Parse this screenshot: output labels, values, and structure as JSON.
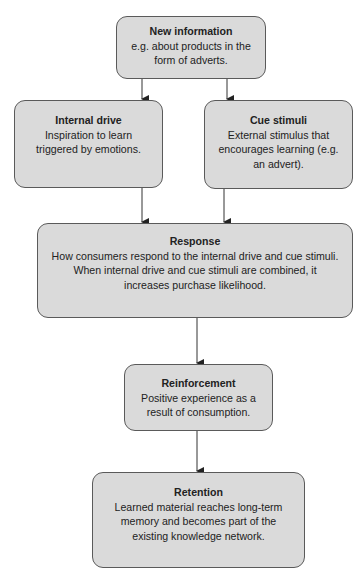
{
  "diagram": {
    "colors": {
      "box_fill": "#dadada",
      "box_border": "#5a5a5a",
      "arrow": "#333333"
    },
    "nodes": [
      {
        "id": "new_information",
        "title": "New information",
        "description": "e.g. about products in the form of adverts."
      },
      {
        "id": "internal_drive",
        "title": "Internal drive",
        "description": "Inspiration to learn triggered by emotions."
      },
      {
        "id": "cue_stimuli",
        "title": "Cue stimuli",
        "description": "External stimulus that encourages learning (e.g. an advert)."
      },
      {
        "id": "response",
        "title": "Response",
        "description": "How consumers respond to the internal drive and cue stimuli. When internal drive and cue stimuli are combined, it increases purchase likelihood."
      },
      {
        "id": "reinforcement",
        "title": "Reinforcement",
        "description": "Positive experience as a result of consumption."
      },
      {
        "id": "retention",
        "title": "Retention",
        "description": "Learned material reaches long-term memory and becomes part of the existing knowledge network."
      }
    ],
    "edges": [
      {
        "from": "new_information",
        "to": "internal_drive"
      },
      {
        "from": "new_information",
        "to": "cue_stimuli"
      },
      {
        "from": "internal_drive",
        "to": "response"
      },
      {
        "from": "cue_stimuli",
        "to": "response"
      },
      {
        "from": "response",
        "to": "reinforcement"
      },
      {
        "from": "reinforcement",
        "to": "retention"
      }
    ]
  }
}
